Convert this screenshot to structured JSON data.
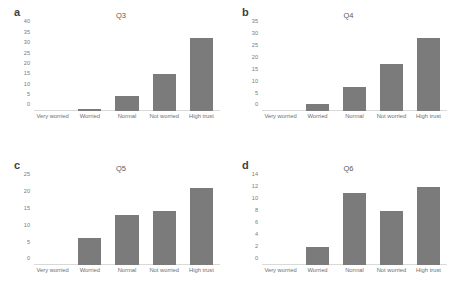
{
  "figure": {
    "background": "#ffffff",
    "bar_color": "#7b7b7b",
    "axis_color": "#d9d9d9",
    "tick_text_color": "#7a7a7a"
  },
  "categories": [
    "Very worried",
    "Worried",
    "Normal",
    "Not worried",
    "High trust"
  ],
  "panels": [
    {
      "letter": "a",
      "title": "Q3",
      "yticks": [
        "0",
        "5",
        "10",
        "15",
        "20",
        "25",
        "30",
        "35",
        "40"
      ],
      "values": [
        0,
        1,
        7,
        18,
        35
      ]
    },
    {
      "letter": "b",
      "title": "Q4",
      "yticks": [
        "0",
        "5",
        "10",
        "15",
        "20",
        "25",
        "30",
        "35"
      ],
      "values": [
        0,
        3,
        10,
        20,
        31
      ]
    },
    {
      "letter": "c",
      "title": "Q5",
      "yticks": [
        "0",
        "5",
        "10",
        "15",
        "20",
        "25"
      ],
      "values": [
        0,
        8,
        15,
        16,
        23
      ]
    },
    {
      "letter": "d",
      "title": "Q6",
      "yticks": [
        "0",
        "2",
        "4",
        "6",
        "8",
        "10",
        "12",
        "14"
      ],
      "values": [
        0,
        3,
        12,
        9,
        13
      ]
    }
  ],
  "chart_data": [
    {
      "type": "bar",
      "title": "Q3",
      "panel": "a",
      "categories": [
        "Very worried",
        "Worried",
        "Normal",
        "Not worried",
        "High trust"
      ],
      "values": [
        0,
        1,
        7,
        18,
        35
      ],
      "xlabel": "",
      "ylabel": "",
      "ylim": [
        0,
        40
      ],
      "ytick_step": 5,
      "grid": false,
      "legend": "none"
    },
    {
      "type": "bar",
      "title": "Q4",
      "panel": "b",
      "categories": [
        "Very worried",
        "Worried",
        "Normal",
        "Not worried",
        "High trust"
      ],
      "values": [
        0,
        3,
        10,
        20,
        31
      ],
      "xlabel": "",
      "ylabel": "",
      "ylim": [
        0,
        35
      ],
      "ytick_step": 5,
      "grid": false,
      "legend": "none"
    },
    {
      "type": "bar",
      "title": "Q5",
      "panel": "c",
      "categories": [
        "Very worried",
        "Worried",
        "Normal",
        "Not worried",
        "High trust"
      ],
      "values": [
        0,
        8,
        15,
        16,
        23
      ],
      "xlabel": "",
      "ylabel": "",
      "ylim": [
        0,
        25
      ],
      "ytick_step": 5,
      "grid": false,
      "legend": "none"
    },
    {
      "type": "bar",
      "title": "Q6",
      "panel": "d",
      "categories": [
        "Very worried",
        "Worried",
        "Normal",
        "Not worried",
        "High trust"
      ],
      "values": [
        0,
        3,
        12,
        9,
        13
      ],
      "xlabel": "",
      "ylabel": "",
      "ylim": [
        0,
        14
      ],
      "ytick_step": 2,
      "grid": false,
      "legend": "none"
    }
  ]
}
